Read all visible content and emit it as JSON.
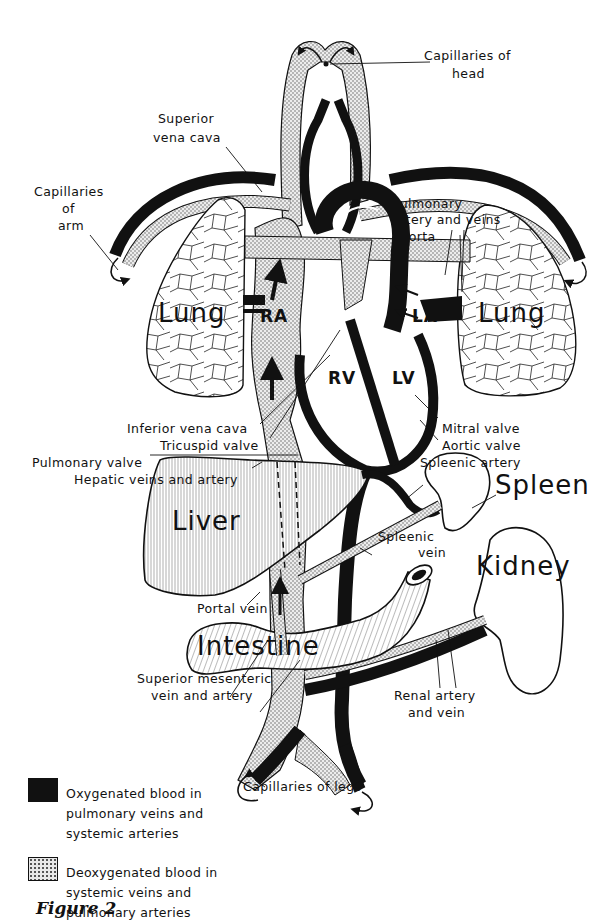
{
  "diagram": {
    "type": "circulatory-system-schematic",
    "organs": {
      "lung_left": "Lung",
      "lung_right": "Lung",
      "liver": "Liver",
      "spleen": "Spleen",
      "kidney": "Kidney",
      "intestine": "Intestine"
    },
    "chambers": {
      "ra": "RA",
      "la": "LA",
      "rv": "RV",
      "lv": "LV"
    },
    "labels": {
      "capillaries_head_1": "Capillaries of",
      "capillaries_head_2": "head",
      "superior_vena_cava_1": "Superior",
      "superior_vena_cava_2": "vena cava",
      "capillaries_arm_1": "Capillaries",
      "capillaries_arm_2": "of",
      "capillaries_arm_3": "arm",
      "pulmonary_artery_veins_1": "Pulmonary",
      "pulmonary_artery_veins_2": "artery and veins",
      "aorta": "Aorta",
      "inferior_vena_cava": "Inferior vena cava",
      "tricuspid_valve": "Tricuspid valve",
      "pulmonary_valve": "Pulmonary valve",
      "hepatic_veins_artery": "Hepatic veins and artery",
      "mitral_valve": "Mitral valve",
      "aortic_valve": "Aortic valve",
      "spleenic_artery": "Spleenic artery",
      "spleenic_vein_1": "Spleenic",
      "spleenic_vein_2": "vein",
      "portal_vein": "Portal vein",
      "superior_mesenteric_1": "Superior mesenteric",
      "superior_mesenteric_2": "vein and artery",
      "renal_1": "Renal artery",
      "renal_2": "and vein",
      "capillaries_legs": "Capillaries of legs"
    },
    "colors": {
      "oxygenated": "#111111",
      "deoxygenated_fill": "#e6e6e6",
      "deoxygenated_stipple": "#555555",
      "outline": "#111111",
      "background": "#ffffff"
    }
  },
  "legend": {
    "items": [
      {
        "key": "oxygenated",
        "line1": "Oxygenated blood in",
        "line2": "pulmonary veins and",
        "line3": "systemic arteries"
      },
      {
        "key": "deoxygenated",
        "line1": "Deoxygenated blood in",
        "line2": "systemic veins and",
        "line3": "pulmonary arteries"
      }
    ]
  },
  "caption": {
    "text": "Figure 2"
  }
}
